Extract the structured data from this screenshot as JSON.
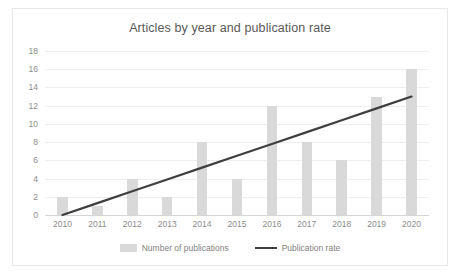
{
  "chart_data": {
    "type": "bar",
    "title": "Articles by year and publication rate",
    "xlabel": "",
    "ylabel": "",
    "categories": [
      "2010",
      "2011",
      "2012",
      "2013",
      "2014",
      "2015",
      "2016",
      "2017",
      "2018",
      "2019",
      "2020"
    ],
    "ylim": [
      0,
      18
    ],
    "yticks": [
      0,
      2,
      4,
      6,
      8,
      10,
      12,
      14,
      16,
      18
    ],
    "grid": true,
    "legend_position": "bottom",
    "series": [
      {
        "name": "Number of publications",
        "type": "bar",
        "color": "#d9d9d9",
        "values": [
          2,
          1,
          4,
          2,
          8,
          4,
          12,
          8,
          6,
          13,
          16
        ]
      },
      {
        "name": "Publication rate",
        "type": "line",
        "color": "#3f3f3f",
        "values": [
          0,
          1.3,
          2.6,
          3.9,
          5.2,
          6.5,
          7.8,
          9.1,
          10.4,
          11.7,
          13
        ]
      }
    ]
  },
  "legend": {
    "items": [
      {
        "label": "Number of publications",
        "marker": "bar-swatch"
      },
      {
        "label": "Publication rate",
        "marker": "line-swatch"
      }
    ]
  },
  "colors": {
    "bar": "#d9d9d9",
    "line": "#3f3f3f",
    "grid": "#eeeeee",
    "axis": "#d6d6d6",
    "tick_text": "#8c8c8c",
    "title_text": "#595959",
    "frame": "#e8e8e8"
  }
}
